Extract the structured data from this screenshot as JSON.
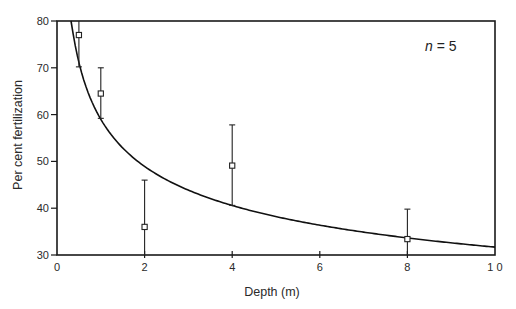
{
  "chart_data": {
    "type": "scatter",
    "title": "",
    "xlabel": "Depth (m)",
    "ylabel": "Per cent fertilization",
    "xlim": [
      0,
      10
    ],
    "ylim": [
      30,
      80
    ],
    "xticks": [
      0,
      2,
      4,
      6,
      8,
      10
    ],
    "xtick_labels": [
      "0",
      "2",
      "4",
      "6",
      "8",
      "1 0"
    ],
    "yticks": [
      30,
      40,
      50,
      60,
      70,
      80
    ],
    "ytick_labels": [
      "30",
      "40",
      "50",
      "60",
      "70",
      "80"
    ],
    "grid": false,
    "annotation": {
      "var": "n",
      "eq": " = ",
      "value": "5"
    },
    "series": [
      {
        "name": "Observed mean ± error",
        "marker": "open-square",
        "points": [
          {
            "x": 0.5,
            "y": 77.0,
            "y_low": 70.2,
            "y_high": 80.0
          },
          {
            "x": 1.0,
            "y": 64.5,
            "y_low": 59.2,
            "y_high": 70.0
          },
          {
            "x": 2.0,
            "y": 36.0,
            "y_low": 30.0,
            "y_high": 46.0
          },
          {
            "x": 4.0,
            "y": 49.1,
            "y_low": 40.6,
            "y_high": 57.8
          },
          {
            "x": 8.0,
            "y": 33.4,
            "y_low": 30.0,
            "y_high": 39.8
          }
        ]
      },
      {
        "name": "Fitted power curve",
        "type": "line",
        "model": "y = a * x^b",
        "a": 59,
        "b": -0.27,
        "x_range": [
          0.32,
          10
        ]
      }
    ]
  }
}
